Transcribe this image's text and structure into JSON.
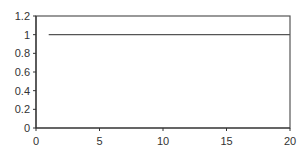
{
  "chart_data": {
    "type": "line",
    "title": "",
    "xlabel": "",
    "ylabel": "",
    "xlim": [
      0,
      20
    ],
    "ylim": [
      0,
      1.2
    ],
    "x_ticks": [
      "0",
      "5",
      "10",
      "15",
      "20"
    ],
    "y_ticks": [
      "0",
      "0.2",
      "0.4",
      "0.6",
      "0.8",
      "1",
      "1.2"
    ],
    "grid": false,
    "legend": null,
    "series": [
      {
        "name": "",
        "x": [
          1,
          2,
          3,
          4,
          5,
          6,
          7,
          8,
          9,
          10,
          11,
          12,
          13,
          14,
          15,
          16,
          17,
          18,
          19,
          20
        ],
        "values": [
          1,
          1,
          1,
          1,
          1,
          1,
          1,
          1,
          1,
          1,
          1,
          1,
          1,
          1,
          1,
          1,
          1,
          1,
          1,
          1
        ],
        "color": "#555555"
      }
    ]
  },
  "colors": {
    "axis": "#333333",
    "frame": "#555555",
    "line": "#555555"
  }
}
